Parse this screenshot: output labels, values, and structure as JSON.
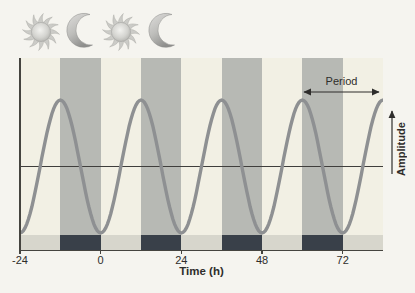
{
  "icons": {
    "sequence": [
      "sun",
      "moon",
      "sun",
      "moon"
    ]
  },
  "plot": {
    "x_axis_title": "Time (h)",
    "x_tick_labels": [
      "-24",
      "0",
      "24",
      "48",
      "72"
    ],
    "period_label": "Period",
    "amplitude_label": "Amplitude"
  },
  "colors": {
    "background": "#f5f4ef",
    "day_band": "#f2f0e4",
    "night_band": "#b7b9b4",
    "day_strip": "#d7d6cc",
    "night_strip": "#394049",
    "curve": "#8e9092",
    "midline": "#3f3e3c",
    "axis": "#45443f",
    "text": "#2e2d2b"
  },
  "chart_data": {
    "type": "line",
    "title": "",
    "xlabel": "Time (h)",
    "ylabel": "Amplitude (relative, no scale shown)",
    "x_ticks": [
      -24,
      0,
      24,
      48,
      72
    ],
    "x_range": [
      -24,
      84
    ],
    "y_range_relative": [
      -1,
      1
    ],
    "grid": false,
    "series": [
      {
        "name": "circadian rhythm",
        "waveform": "cosine",
        "equation": "y = -cos(2*pi*t/24)",
        "period_h": 24,
        "amplitude_relative": 1,
        "peaks_at_h": [
          -12,
          12,
          36,
          60
        ],
        "troughs_at_h": [
          -24,
          0,
          24,
          48,
          72
        ]
      }
    ],
    "day_intervals_h": [
      [
        -24,
        -12
      ],
      [
        0,
        12
      ],
      [
        24,
        36
      ],
      [
        48,
        60
      ],
      [
        72,
        84
      ]
    ],
    "night_intervals_h": [
      [
        -12,
        0
      ],
      [
        12,
        24
      ],
      [
        36,
        48
      ],
      [
        60,
        72
      ]
    ],
    "midline_shown": true,
    "annotations": [
      "Period",
      "Amplitude"
    ]
  }
}
